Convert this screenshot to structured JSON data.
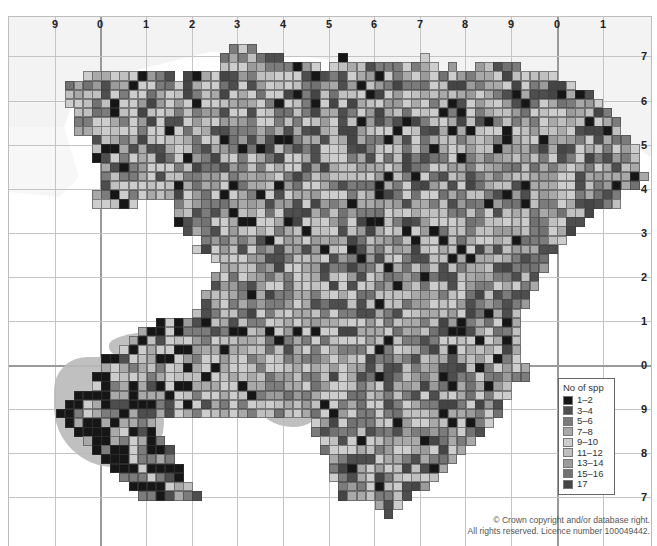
{
  "map": {
    "type": "tetrad distribution map",
    "grid": {
      "top_labels": [
        {
          "label": "9",
          "x": 54
        },
        {
          "label": "0",
          "x": 99
        },
        {
          "label": "1",
          "x": 145
        },
        {
          "label": "2",
          "x": 191
        },
        {
          "label": "3",
          "x": 236
        },
        {
          "label": "4",
          "x": 282
        },
        {
          "label": "5",
          "x": 328
        },
        {
          "label": "6",
          "x": 373
        },
        {
          "label": "7",
          "x": 419
        },
        {
          "label": "8",
          "x": 464
        },
        {
          "label": "9",
          "x": 510
        },
        {
          "label": "0",
          "x": 556
        },
        {
          "label": "1",
          "x": 602
        }
      ],
      "right_labels": [
        {
          "label": "7",
          "y": 55
        },
        {
          "label": "6",
          "y": 100
        },
        {
          "label": "5",
          "y": 144
        },
        {
          "label": "4",
          "y": 188
        },
        {
          "label": "3",
          "y": 232
        },
        {
          "label": "2",
          "y": 276
        },
        {
          "label": "1",
          "y": 320
        },
        {
          "label": "0",
          "y": 364
        },
        {
          "label": "9",
          "y": 408
        },
        {
          "label": "8",
          "y": 452
        },
        {
          "label": "7",
          "y": 496
        }
      ]
    },
    "legend": {
      "title": "No of spp",
      "items": [
        {
          "label": "1–2",
          "color": "#161616"
        },
        {
          "label": "3–4",
          "color": "#4e4e4e"
        },
        {
          "label": "5–6",
          "color": "#7c7c7c"
        },
        {
          "label": "7–8",
          "color": "#a9a9a9"
        },
        {
          "label": "9–10",
          "color": "#cdcdcd"
        },
        {
          "label": "11–12",
          "color": "#c0c0c0"
        },
        {
          "label": "13–14",
          "color": "#9b9b9b"
        },
        {
          "label": "15–16",
          "color": "#727272"
        },
        {
          "label": "17",
          "color": "#454545"
        }
      ]
    },
    "copyright": {
      "line1": "© Crown copyright and/or database right.",
      "line2": "All rights reserved. Licence number 100049442."
    },
    "colors": {
      "sea": "#f3f3f3",
      "land_relief": "#b9b9b9",
      "gridline": "#c4c4c4",
      "cell_border": "#3c3c3c"
    }
  }
}
